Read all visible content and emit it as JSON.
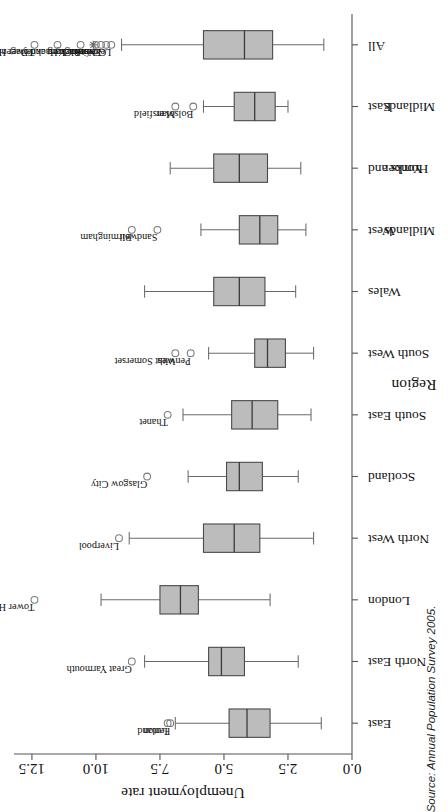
{
  "figure": {
    "source_note": "Source: Annual Population Survey 2005."
  },
  "chart_data": {
    "type": "box",
    "title": "",
    "xlabel": "Region",
    "ylabel": "Unemployment rate",
    "ylim": [
      0.0,
      13.2
    ],
    "yticks": [
      "0.0",
      "2.5",
      "5.0",
      "7.5",
      "10.0",
      "12.5"
    ],
    "ytick_values": [
      0.0,
      2.5,
      5.0,
      7.5,
      10.0,
      12.5
    ],
    "grid": false,
    "legend": "none",
    "categories": [
      "East",
      "North East",
      "London",
      "North West",
      "Scotland",
      "South East",
      "South West",
      "Wales",
      "West Midlands",
      "Yorks and Humber",
      "East Midlands",
      "All"
    ],
    "category_labels_wrapped": [
      [
        "East"
      ],
      [
        "North East"
      ],
      [
        "London"
      ],
      [
        "North West"
      ],
      [
        "Scotland"
      ],
      [
        "South East"
      ],
      [
        "South West"
      ],
      [
        "Wales"
      ],
      [
        "West",
        "Midlands"
      ],
      [
        "Yorks and",
        "Humber"
      ],
      [
        "East",
        "Midlands"
      ],
      [
        "All"
      ]
    ],
    "boxes": [
      {
        "category": "East",
        "whisker_low": 1.2,
        "q1": 3.2,
        "median": 4.1,
        "q3": 4.8,
        "whisker_high": 6.9,
        "outliers": [
          {
            "label": "Fenland",
            "value": 7.1
          },
          {
            "label": "Luton",
            "value": 7.2
          }
        ]
      },
      {
        "category": "North East",
        "whisker_low": 2.1,
        "q1": 4.2,
        "median": 5.1,
        "q3": 5.6,
        "whisker_high": 8.1,
        "outliers": [
          {
            "label": "Great Yarmouth",
            "value": 8.6
          }
        ]
      },
      {
        "category": "London",
        "whisker_low": 3.2,
        "q1": 6.0,
        "median": 6.7,
        "q3": 7.5,
        "whisker_high": 9.8,
        "outliers": [
          {
            "label": "Tower Hamlets",
            "value": 12.4
          }
        ]
      },
      {
        "category": "North West",
        "whisker_low": 1.5,
        "q1": 3.6,
        "median": 4.6,
        "q3": 5.8,
        "whisker_high": 8.7,
        "outliers": [
          {
            "label": "Liverpool",
            "value": 9.1
          }
        ]
      },
      {
        "category": "Scotland",
        "whisker_low": 2.1,
        "q1": 3.5,
        "median": 4.4,
        "q3": 4.9,
        "whisker_high": 6.4,
        "outliers": [
          {
            "label": "Glasgow City",
            "value": 8.0
          }
        ]
      },
      {
        "category": "South East",
        "whisker_low": 1.6,
        "q1": 2.9,
        "median": 3.9,
        "q3": 4.7,
        "whisker_high": 6.6,
        "outliers": [
          {
            "label": "Thanet",
            "value": 7.2
          }
        ]
      },
      {
        "category": "South West",
        "whisker_low": 1.5,
        "q1": 2.6,
        "median": 3.3,
        "q3": 3.8,
        "whisker_high": 5.6,
        "outliers": [
          {
            "label": "Penwith",
            "value": 6.3
          },
          {
            "label": "West Somerset",
            "value": 6.9
          }
        ]
      },
      {
        "category": "Wales",
        "whisker_low": 2.2,
        "q1": 3.4,
        "median": 4.4,
        "q3": 5.4,
        "whisker_high": 8.1,
        "outliers": []
      },
      {
        "category": "West Midlands",
        "whisker_low": 1.8,
        "q1": 2.9,
        "median": 3.6,
        "q3": 4.4,
        "whisker_high": 5.9,
        "outliers": [
          {
            "label": "Sandwell",
            "value": 7.6
          },
          {
            "label": "Birmingham",
            "value": 8.6
          }
        ]
      },
      {
        "category": "Yorks and Humber",
        "whisker_low": 2.0,
        "q1": 3.3,
        "median": 4.4,
        "q3": 5.4,
        "whisker_high": 7.1,
        "outliers": []
      },
      {
        "category": "East Midlands",
        "whisker_low": 2.5,
        "q1": 3.0,
        "median": 3.8,
        "q3": 4.6,
        "whisker_high": 5.8,
        "outliers": [
          {
            "label": "Bolsover",
            "value": 6.2
          },
          {
            "label": "Mansfield",
            "value": 6.9
          }
        ]
      },
      {
        "category": "All",
        "whisker_low": 1.1,
        "q1": 3.1,
        "median": 4.2,
        "q3": 5.8,
        "whisker_high": 9.0,
        "outliers": [
          {
            "label": "Leicester City",
            "value": 9.4
          },
          {
            "label": "Greenwich",
            "value": 9.6
          },
          {
            "label": "Enfield",
            "value": 9.8
          },
          {
            "label": "Nottingham",
            "value": 10.0
          },
          {
            "label": "Barking and Dagenham",
            "value": 10.6
          },
          {
            "label": "Hackney",
            "value": 11.5
          },
          {
            "label": "Tower Hamlets",
            "value": 12.4
          }
        ],
        "extreme_markers": [
          {
            "label": "Nottingham",
            "value": 10.1,
            "symbol": "star"
          }
        ]
      }
    ],
    "colors": {
      "box_fill": "#bcbcbc",
      "box_stroke": "#4a4a4a",
      "median": "#3a3a3a",
      "whisker": "#6a6a6a",
      "axis": "#555555",
      "text": "#111111",
      "background": "#ffffff"
    }
  }
}
